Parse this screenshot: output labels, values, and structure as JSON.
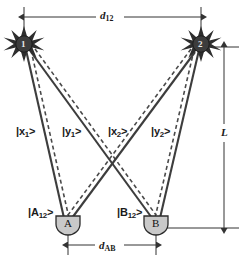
{
  "figure": {
    "background_color": "#ffffff",
    "line_color": "#333333",
    "detector_fill": "#c9c9c9",
    "source_fill": "#3a3a3a"
  },
  "sources": [
    {
      "name": "source-1",
      "label": "1",
      "x": 24,
      "y": 44
    },
    {
      "name": "source-2",
      "label": "2",
      "x": 201,
      "y": 44
    }
  ],
  "detectors": [
    {
      "name": "detector-a",
      "label": "A",
      "x": 68,
      "y": 226,
      "state_label": "|A",
      "state_sub": "12",
      "state_close": ">"
    },
    {
      "name": "detector-b",
      "label": "B",
      "x": 156,
      "y": 226,
      "state_label": "|B",
      "state_sub": "12",
      "state_close": ">"
    }
  ],
  "path_labels": [
    {
      "name": "path-x1",
      "prefix": "|x",
      "sub": "1",
      "suffix": ">",
      "x": 16,
      "y": 126
    },
    {
      "name": "path-y1",
      "prefix": "|y",
      "sub": "1",
      "suffix": ">",
      "x": 62,
      "y": 126
    },
    {
      "name": "path-x2",
      "prefix": "|x",
      "sub": "2",
      "suffix": ">",
      "x": 108,
      "y": 126
    },
    {
      "name": "path-y2",
      "prefix": "|y",
      "sub": "2",
      "suffix": ">",
      "x": 151,
      "y": 126
    }
  ],
  "dimensions": [
    {
      "name": "dimension-d12",
      "prefix": "d",
      "sub": "12",
      "x": 106,
      "y": 13,
      "orientation": "horizontal"
    },
    {
      "name": "dimension-dab",
      "prefix": "d",
      "sub": "AB",
      "x": 104,
      "y": 245,
      "orientation": "horizontal"
    },
    {
      "name": "dimension-L",
      "prefix": "L",
      "sub": "",
      "x": 228,
      "y": 133,
      "orientation": "vertical"
    }
  ]
}
